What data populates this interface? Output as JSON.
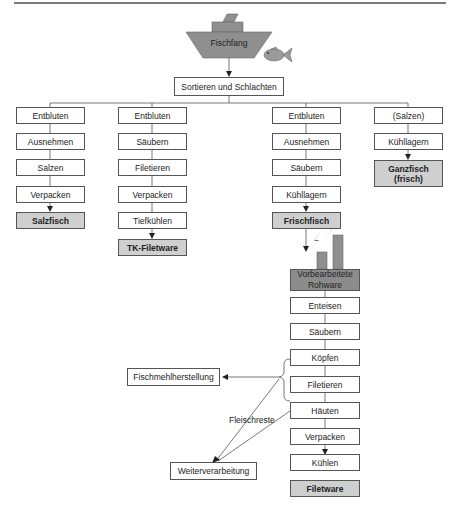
{
  "source": {
    "label": "Fischfang"
  },
  "sort_step": {
    "label": "Sortieren und Schlachten"
  },
  "columns": [
    {
      "steps": [
        "Entbluten",
        "Ausnehmen",
        "Salzen",
        "Verpacken"
      ],
      "product": "Salzfisch"
    },
    {
      "steps": [
        "Entbluten",
        "Säubern",
        "Filetieren",
        "Verpacken",
        "Tiefkühlen"
      ],
      "product": "TK-Filetware"
    },
    {
      "steps": [
        "Entbluten",
        "Ausnehmen",
        "Säubern",
        "Kühllagern"
      ],
      "product": "Frischfisch"
    },
    {
      "steps": [
        "(Salzen)",
        "Kühllagern"
      ],
      "product_line1": "Ganzfisch",
      "product_line2": "(frisch)"
    }
  ],
  "factory": {
    "line1": "Vorbearbeitete",
    "line2": "Rohware"
  },
  "processing_steps": [
    "Enteisen",
    "Säubern",
    "Köpfen",
    "Filetieren",
    "Häuten",
    "Verpacken",
    "Kühlen"
  ],
  "final_product": "Filetware",
  "side_outputs": {
    "fishmeal": "Fischmehlherstellung",
    "further": "Weiterverarbeitung",
    "residue_label": "Fleischreste"
  },
  "colors": {
    "output_fill": "#cfcfcf",
    "factory_fill": "#8c8c8c",
    "boat_fill": "#8f8f8f",
    "line": "#555555"
  }
}
